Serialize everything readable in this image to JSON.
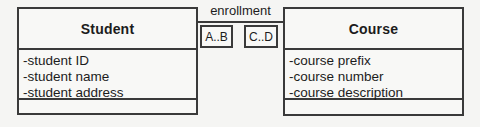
{
  "diagram": {
    "classes": [
      {
        "name": "Student",
        "attributes": [
          "-student ID",
          "-student name",
          "-student address"
        ]
      },
      {
        "name": "Course",
        "attributes": [
          "-course prefix",
          "-course number",
          "-course description"
        ]
      }
    ],
    "association": {
      "label": "enrollment",
      "multiplicity_left": "A..B",
      "multiplicity_right": "C..D"
    },
    "colors": {
      "border": "#3a3a3a",
      "background": "#f5f5f3",
      "text": "#1c1c1c"
    }
  }
}
